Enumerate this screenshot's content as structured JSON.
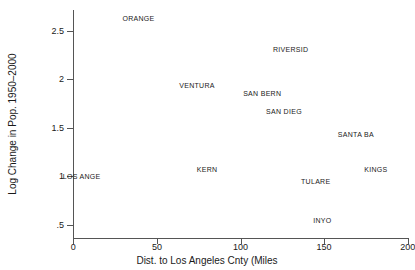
{
  "chart_data": {
    "type": "scatter",
    "title": "",
    "xlabel": "Dist. to Los Angeles Cnty (Miles",
    "ylabel": "Log Change in Pop. 1950–2000",
    "xlim": [
      0,
      200
    ],
    "ylim": [
      0.4,
      2.75
    ],
    "grid": false,
    "legend": "none",
    "marker_style": "text-label-only",
    "xticks": [
      {
        "value": 0,
        "label": "0"
      },
      {
        "value": 50,
        "label": "50"
      },
      {
        "value": 100,
        "label": "100"
      },
      {
        "value": 150,
        "label": "150"
      },
      {
        "value": 200,
        "label": "200"
      }
    ],
    "yticks": [
      {
        "value": 0.5,
        "label": ".5"
      },
      {
        "value": 1.0,
        "label": "1"
      },
      {
        "value": 1.5,
        "label": "1.5"
      },
      {
        "value": 2.0,
        "label": "2"
      },
      {
        "value": 2.5,
        "label": "2.5"
      }
    ],
    "points": [
      {
        "label": "ORANGE",
        "x": 39,
        "y": 2.63
      },
      {
        "label": "RIVERSID",
        "x": 130,
        "y": 2.31
      },
      {
        "label": "VENTURA",
        "x": 74,
        "y": 1.94
      },
      {
        "label": "SAN BERN",
        "x": 113,
        "y": 1.86
      },
      {
        "label": "SAN DIEG",
        "x": 126,
        "y": 1.67
      },
      {
        "label": "SANTA BA",
        "x": 169,
        "y": 1.44
      },
      {
        "label": "KERN",
        "x": 80,
        "y": 1.08
      },
      {
        "label": "KINGS",
        "x": 181,
        "y": 1.08
      },
      {
        "label": "LOS ANGE",
        "x": 5,
        "y": 1.0
      },
      {
        "label": "TULARE",
        "x": 145,
        "y": 0.95
      },
      {
        "label": "INYO",
        "x": 149,
        "y": 0.55
      }
    ]
  }
}
